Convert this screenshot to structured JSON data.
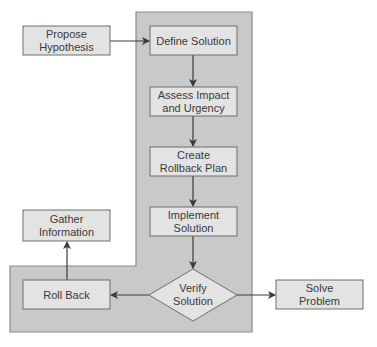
{
  "diagram": {
    "type": "flowchart",
    "colors": {
      "region_fill": "#c9c9c9",
      "region_stroke": "#8a8a8a",
      "box_fill": "#e3e3e3",
      "box_stroke": "#6e6e6e",
      "arrow": "#3a3a3a",
      "text": "#3a3a3a"
    },
    "nodes": {
      "propose_hypothesis": {
        "line1": "Propose",
        "line2": "Hypothesis"
      },
      "define_solution": {
        "line1": "Define Solution"
      },
      "assess_impact": {
        "line1": "Assess Impact",
        "line2": "and Urgency"
      },
      "create_rollback": {
        "line1": "Create",
        "line2": "Rollback Plan"
      },
      "implement_solution": {
        "line1": "Implement",
        "line2": "Solution"
      },
      "verify_solution": {
        "line1": "Verify",
        "line2": "Solution",
        "shape": "diamond"
      },
      "roll_back": {
        "line1": "Roll Back"
      },
      "gather_information": {
        "line1": "Gather",
        "line2": "Information"
      },
      "solve_problem": {
        "line1": "Solve",
        "line2": "Problem"
      }
    },
    "edges": [
      {
        "from": "Propose Hypothesis",
        "to": "Define Solution"
      },
      {
        "from": "Define Solution",
        "to": "Assess Impact and Urgency"
      },
      {
        "from": "Assess Impact and Urgency",
        "to": "Create Rollback Plan"
      },
      {
        "from": "Create Rollback Plan",
        "to": "Implement Solution"
      },
      {
        "from": "Implement Solution",
        "to": "Verify Solution"
      },
      {
        "from": "Verify Solution",
        "to": "Roll Back"
      },
      {
        "from": "Verify Solution",
        "to": "Solve Problem"
      },
      {
        "from": "Roll Back",
        "to": "Gather Information"
      }
    ]
  }
}
